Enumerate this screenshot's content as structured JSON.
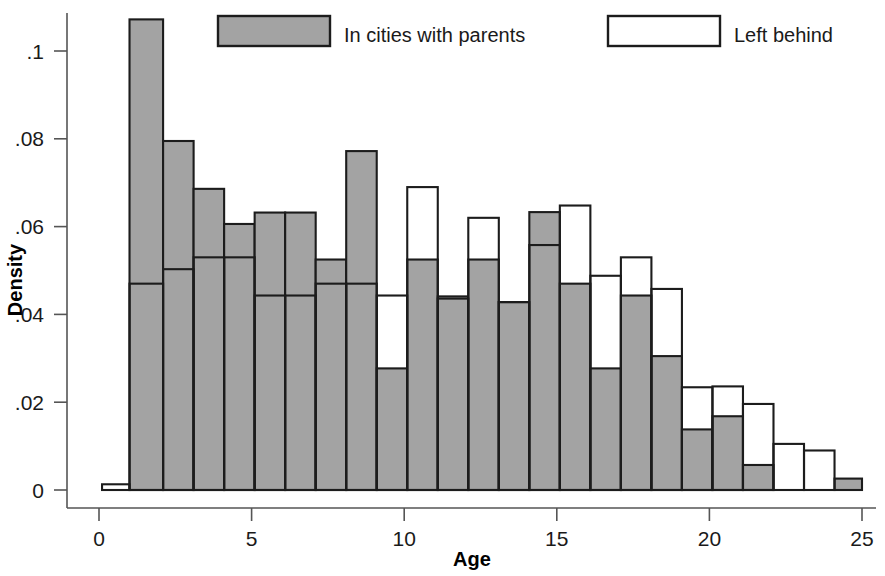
{
  "chart_data": {
    "type": "bar",
    "title": "",
    "subtitle": "",
    "xlabel": "Age",
    "ylabel": "Density",
    "grid": false,
    "legend_position": "top",
    "xlim": [
      0,
      25
    ],
    "ylim": [
      0,
      0.112
    ],
    "xticks": [
      0,
      5,
      10,
      15,
      20,
      25
    ],
    "xtick_labels": [
      "0",
      "5",
      "10",
      "15",
      "20",
      "25"
    ],
    "yticks": [
      0,
      0.02,
      0.04,
      0.06,
      0.08,
      0.1
    ],
    "ytick_labels": [
      "0",
      ".02",
      ".04",
      ".06",
      ".08",
      ".1"
    ],
    "bin_width": 1,
    "series": [
      {
        "name": "In cities with parents",
        "style": "filled-gray",
        "color": "#a3a3a3",
        "edge_color": "#1c1c1c",
        "bins": [
          {
            "x0": 1.0,
            "x1": 2.1,
            "value": 0.1072
          },
          {
            "x0": 2.1,
            "x1": 3.1,
            "value": 0.0795
          },
          {
            "x0": 3.1,
            "x1": 4.1,
            "value": 0.0686
          },
          {
            "x0": 4.1,
            "x1": 5.1,
            "value": 0.0606
          },
          {
            "x0": 5.1,
            "x1": 6.1,
            "value": 0.0632
          },
          {
            "x0": 6.1,
            "x1": 7.1,
            "value": 0.0632
          },
          {
            "x0": 7.1,
            "x1": 8.1,
            "value": 0.0525
          },
          {
            "x0": 8.1,
            "x1": 9.1,
            "value": 0.0772
          },
          {
            "x0": 9.1,
            "x1": 10.1,
            "value": 0.0277
          },
          {
            "x0": 10.1,
            "x1": 11.1,
            "value": 0.0525
          },
          {
            "x0": 11.1,
            "x1": 12.1,
            "value": 0.0441
          },
          {
            "x0": 12.1,
            "x1": 13.1,
            "value": 0.0525
          },
          {
            "x0": 13.1,
            "x1": 14.1,
            "value": 0.0428
          },
          {
            "x0": 14.1,
            "x1": 15.1,
            "value": 0.0633
          },
          {
            "x0": 15.1,
            "x1": 16.1,
            "value": 0.047
          },
          {
            "x0": 16.1,
            "x1": 17.1,
            "value": 0.0277
          },
          {
            "x0": 17.1,
            "x1": 18.1,
            "value": 0.0443
          },
          {
            "x0": 18.1,
            "x1": 19.1,
            "value": 0.0305
          },
          {
            "x0": 19.1,
            "x1": 20.1,
            "value": 0.0138
          },
          {
            "x0": 20.1,
            "x1": 21.1,
            "value": 0.0168
          },
          {
            "x0": 21.1,
            "x1": 22.1,
            "value": 0.0057
          },
          {
            "x0": 24.1,
            "x1": 25.0,
            "value": 0.0026
          }
        ]
      },
      {
        "name": "Left behind",
        "style": "outline-white",
        "color": "#ffffff",
        "edge_color": "#1c1c1c",
        "bins": [
          {
            "x0": 0.1,
            "x1": 1.0,
            "value": 0.0013
          },
          {
            "x0": 1.0,
            "x1": 2.1,
            "value": 0.047
          },
          {
            "x0": 2.1,
            "x1": 3.1,
            "value": 0.0503
          },
          {
            "x0": 3.1,
            "x1": 4.1,
            "value": 0.053
          },
          {
            "x0": 4.1,
            "x1": 5.1,
            "value": 0.053
          },
          {
            "x0": 5.1,
            "x1": 6.1,
            "value": 0.0443
          },
          {
            "x0": 6.1,
            "x1": 7.1,
            "value": 0.0443
          },
          {
            "x0": 7.1,
            "x1": 8.1,
            "value": 0.047
          },
          {
            "x0": 8.1,
            "x1": 9.1,
            "value": 0.047
          },
          {
            "x0": 9.1,
            "x1": 10.1,
            "value": 0.0443
          },
          {
            "x0": 10.1,
            "x1": 11.1,
            "value": 0.069
          },
          {
            "x0": 11.1,
            "x1": 12.1,
            "value": 0.0436
          },
          {
            "x0": 12.1,
            "x1": 13.1,
            "value": 0.062
          },
          {
            "x0": 13.1,
            "x1": 14.1,
            "value": 0.0428
          },
          {
            "x0": 14.1,
            "x1": 15.1,
            "value": 0.0558
          },
          {
            "x0": 15.1,
            "x1": 16.1,
            "value": 0.0648
          },
          {
            "x0": 16.1,
            "x1": 17.1,
            "value": 0.0488
          },
          {
            "x0": 17.1,
            "x1": 18.1,
            "value": 0.053
          },
          {
            "x0": 18.1,
            "x1": 19.1,
            "value": 0.0458
          },
          {
            "x0": 19.1,
            "x1": 20.1,
            "value": 0.0234
          },
          {
            "x0": 20.1,
            "x1": 21.1,
            "value": 0.0236
          },
          {
            "x0": 21.1,
            "x1": 22.1,
            "value": 0.0196
          },
          {
            "x0": 22.1,
            "x1": 23.1,
            "value": 0.0105
          },
          {
            "x0": 23.1,
            "x1": 24.1,
            "value": 0.009
          }
        ]
      }
    ]
  },
  "legend": {
    "items": [
      {
        "label": "In cities with parents",
        "style": "filled-gray"
      },
      {
        "label": "Left behind",
        "style": "outline-white"
      }
    ]
  },
  "axes": {
    "x_title": "Age",
    "y_title": "Density"
  }
}
